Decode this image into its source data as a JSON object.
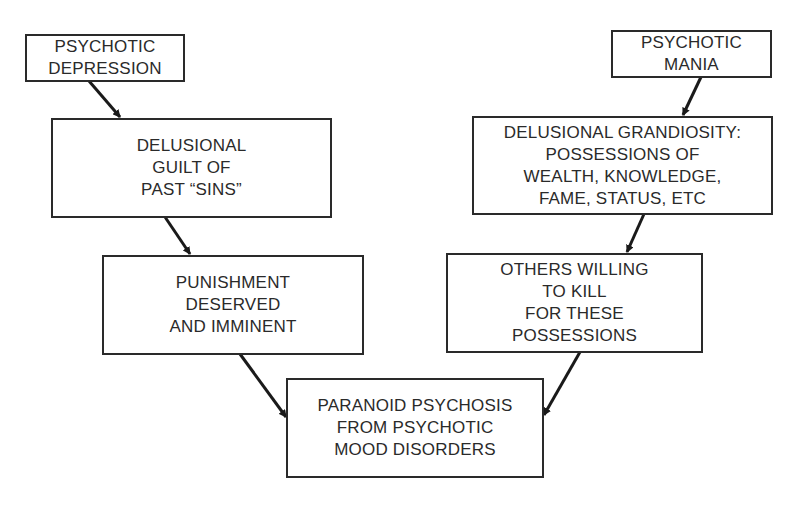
{
  "diagram": {
    "type": "flowchart",
    "nodes": [
      {
        "id": "psychotic_depression",
        "label": "PSYCHOTIC\nDEPRESSION"
      },
      {
        "id": "delusional_guilt",
        "label": "DELUSIONAL\nGUILT OF\nPAST “SINS”"
      },
      {
        "id": "punishment",
        "label": "PUNISHMENT\nDESERVED\nAND IMMINENT"
      },
      {
        "id": "psychotic_mania",
        "label": "PSYCHOTIC\nMANIA"
      },
      {
        "id": "delusional_grandiosity",
        "label": "DELUSIONAL GRANDIOSITY:\nPOSSESSIONS OF\nWEALTH, KNOWLEDGE,\nFAME, STATUS, ETC"
      },
      {
        "id": "others_willing",
        "label": "OTHERS WILLING\nTO KILL\nFOR THESE\nPOSSESSIONS"
      },
      {
        "id": "paranoid_psychosis",
        "label": "PARANOID PSYCHOSIS\nFROM PSYCHOTIC\nMOOD DISORDERS"
      }
    ],
    "edges": [
      {
        "from": "psychotic_depression",
        "to": "delusional_guilt"
      },
      {
        "from": "delusional_guilt",
        "to": "punishment"
      },
      {
        "from": "punishment",
        "to": "paranoid_psychosis"
      },
      {
        "from": "psychotic_mania",
        "to": "delusional_grandiosity"
      },
      {
        "from": "delusional_grandiosity",
        "to": "others_willing"
      },
      {
        "from": "others_willing",
        "to": "paranoid_psychosis"
      }
    ]
  }
}
